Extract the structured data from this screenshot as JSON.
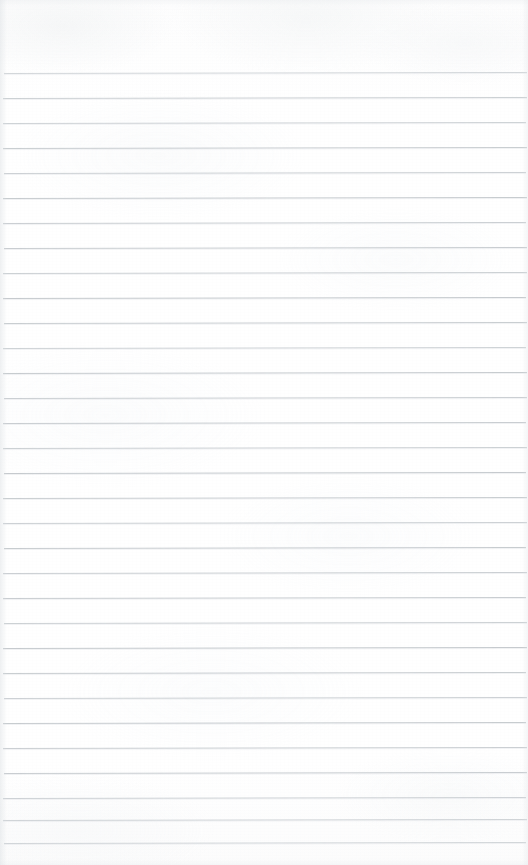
{
  "document": {
    "kind": "scanned-ruled-notebook-page",
    "title": "Blank Ruled Notebook Page",
    "content_text": "",
    "has_handwriting": false,
    "has_printed_text": false,
    "has_margin_rule": false,
    "page_width_px": 528,
    "page_height_px": 865
  },
  "paper": {
    "background_color": "#fefefe",
    "base_tone_color": "#fdfdfd",
    "texture_color": "#e9edef",
    "edge_shadow_color": "#dee2e5"
  },
  "ruling": {
    "line_color": "#c4c9cd",
    "line_thickness_px": 1,
    "line_spacing_px": 25,
    "first_line_y_px": 73,
    "last_line_y_px": 843,
    "line_count": 32,
    "left_margin_px": 3,
    "right_margin_px": 2,
    "top_blank_px": 73,
    "bottom_blank_px": 22,
    "slant_deg": -0.12,
    "lines": [
      {
        "index": 1,
        "y": 73,
        "opacity": 0.8,
        "color": "#c9ced2",
        "left": 4,
        "right": 1
      },
      {
        "index": 2,
        "y": 98,
        "opacity": 0.88,
        "color": "#c6cbcf",
        "left": 3,
        "right": 1
      },
      {
        "index": 3,
        "y": 123,
        "opacity": 0.86,
        "color": "#c7ccd0",
        "left": 3,
        "right": 2
      },
      {
        "index": 4,
        "y": 148,
        "opacity": 0.9,
        "color": "#c4c9cd",
        "left": 3,
        "right": 1
      },
      {
        "index": 5,
        "y": 173,
        "opacity": 0.87,
        "color": "#c6cbcf",
        "left": 4,
        "right": 2
      },
      {
        "index": 6,
        "y": 198,
        "opacity": 0.92,
        "color": "#c3c8cc",
        "left": 3,
        "right": 1
      },
      {
        "index": 7,
        "y": 223,
        "opacity": 0.89,
        "color": "#c5cace",
        "left": 3,
        "right": 2
      },
      {
        "index": 8,
        "y": 248,
        "opacity": 0.91,
        "color": "#c4c9cd",
        "left": 4,
        "right": 1
      },
      {
        "index": 9,
        "y": 273,
        "opacity": 0.88,
        "color": "#c6cbcf",
        "left": 3,
        "right": 1
      },
      {
        "index": 10,
        "y": 298,
        "opacity": 0.93,
        "color": "#c2c7cb",
        "left": 3,
        "right": 2
      },
      {
        "index": 11,
        "y": 323,
        "opacity": 0.9,
        "color": "#c4c9cd",
        "left": 4,
        "right": 1
      },
      {
        "index": 12,
        "y": 348,
        "opacity": 0.86,
        "color": "#c7ccd0",
        "left": 3,
        "right": 2
      },
      {
        "index": 13,
        "y": 373,
        "opacity": 0.92,
        "color": "#c3c8cc",
        "left": 3,
        "right": 1
      },
      {
        "index": 14,
        "y": 398,
        "opacity": 0.89,
        "color": "#c5cace",
        "left": 4,
        "right": 1
      },
      {
        "index": 15,
        "y": 423,
        "opacity": 0.91,
        "color": "#c4c9cd",
        "left": 3,
        "right": 2
      },
      {
        "index": 16,
        "y": 448,
        "opacity": 0.88,
        "color": "#c6cbcf",
        "left": 3,
        "right": 1
      },
      {
        "index": 17,
        "y": 473,
        "opacity": 0.93,
        "color": "#c2c7cb",
        "left": 4,
        "right": 2
      },
      {
        "index": 18,
        "y": 498,
        "opacity": 0.9,
        "color": "#c4c9cd",
        "left": 3,
        "right": 1
      },
      {
        "index": 19,
        "y": 523,
        "opacity": 0.87,
        "color": "#c6cbcf",
        "left": 3,
        "right": 1
      },
      {
        "index": 20,
        "y": 548,
        "opacity": 0.92,
        "color": "#c3c8cc",
        "left": 4,
        "right": 2
      },
      {
        "index": 21,
        "y": 573,
        "opacity": 0.89,
        "color": "#c5cace",
        "left": 3,
        "right": 1
      },
      {
        "index": 22,
        "y": 598,
        "opacity": 0.91,
        "color": "#c4c9cd",
        "left": 3,
        "right": 2
      },
      {
        "index": 23,
        "y": 623,
        "opacity": 0.88,
        "color": "#c6cbcf",
        "left": 4,
        "right": 1
      },
      {
        "index": 24,
        "y": 648,
        "opacity": 0.93,
        "color": "#c2c7cb",
        "left": 3,
        "right": 1
      },
      {
        "index": 25,
        "y": 673,
        "opacity": 0.9,
        "color": "#c4c9cd",
        "left": 3,
        "right": 2
      },
      {
        "index": 26,
        "y": 698,
        "opacity": 0.87,
        "color": "#c6cbcf",
        "left": 4,
        "right": 1
      },
      {
        "index": 27,
        "y": 723,
        "opacity": 0.92,
        "color": "#c3c8cc",
        "left": 3,
        "right": 2
      },
      {
        "index": 28,
        "y": 748,
        "opacity": 0.89,
        "color": "#c5cace",
        "left": 3,
        "right": 1
      },
      {
        "index": 29,
        "y": 773,
        "opacity": 0.91,
        "color": "#c4c9cd",
        "left": 4,
        "right": 1
      },
      {
        "index": 30,
        "y": 798,
        "opacity": 0.86,
        "color": "#c7ccd0",
        "left": 3,
        "right": 2
      },
      {
        "index": 31,
        "y": 820,
        "opacity": 0.84,
        "color": "#c8cdd1",
        "left": 3,
        "right": 1
      },
      {
        "index": 32,
        "y": 843,
        "opacity": 0.82,
        "color": "#c9ced2",
        "left": 4,
        "right": 2
      }
    ]
  }
}
